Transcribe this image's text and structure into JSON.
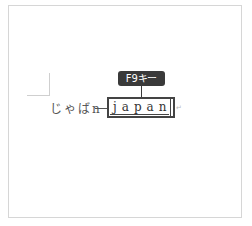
{
  "tooltip": {
    "label": "F9キー"
  },
  "document": {
    "typed_text": "じゃばn",
    "conversion_text": "japan",
    "paragraph_mark": "↵"
  },
  "colors": {
    "tooltip_bg": "#3a3a3a",
    "tooltip_fg": "#ffffff",
    "box_border": "#444444",
    "text": "#555555",
    "frame": "#d6d6d6"
  }
}
